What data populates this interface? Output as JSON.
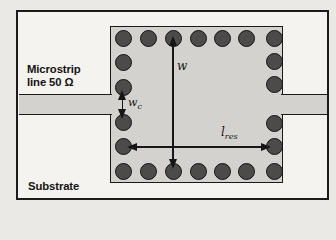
{
  "diagram": {
    "kind": "microstrip-fed via-hole resonator layout (top view)",
    "labels": {
      "microstrip_line1": "Microstrip",
      "microstrip_line2": "line 50 Ω",
      "substrate": "Substrate",
      "width_dim": {
        "main": "w",
        "sub": ""
      },
      "feed_width_dim": {
        "main": "w",
        "sub": "c"
      },
      "length_dim": {
        "main": "l",
        "sub": "res"
      }
    },
    "colors": {
      "page_bg": "#ebe9e6",
      "substrate_fill": "#f4f3ef",
      "conductor_fill": "#d3d2ce",
      "via_fill": "#4c4b4a",
      "outline": "#1b1b1b"
    },
    "vias": [
      {
        "x": 123,
        "y": 38
      },
      {
        "x": 148,
        "y": 38
      },
      {
        "x": 173,
        "y": 38
      },
      {
        "x": 198,
        "y": 38
      },
      {
        "x": 222,
        "y": 38
      },
      {
        "x": 246,
        "y": 38
      },
      {
        "x": 274,
        "y": 38
      },
      {
        "x": 123,
        "y": 62
      },
      {
        "x": 123,
        "y": 87
      },
      {
        "x": 123,
        "y": 122
      },
      {
        "x": 123,
        "y": 146
      },
      {
        "x": 274,
        "y": 61
      },
      {
        "x": 274,
        "y": 84
      },
      {
        "x": 274,
        "y": 123
      },
      {
        "x": 274,
        "y": 146
      },
      {
        "x": 123,
        "y": 171
      },
      {
        "x": 148,
        "y": 171
      },
      {
        "x": 173,
        "y": 171
      },
      {
        "x": 198,
        "y": 171
      },
      {
        "x": 222,
        "y": 171
      },
      {
        "x": 246,
        "y": 171
      },
      {
        "x": 274,
        "y": 171
      }
    ]
  }
}
